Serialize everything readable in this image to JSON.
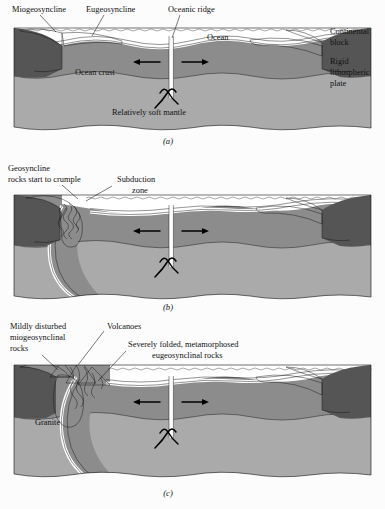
{
  "figure": {
    "background": "#fcfcfc"
  },
  "colors": {
    "continental_block": "#555555",
    "lithospheric_plate": "#8c8c8c",
    "soft_mantle": "#aaaaaa",
    "ocean_water": "#ffffff",
    "sediment": "#f4f4f4",
    "ink": "#111111",
    "page": "#fcfcfc"
  },
  "panels": [
    {
      "id": "a",
      "caption": "(a)",
      "labels": [
        {
          "name": "miogeosyncline",
          "text": "Miogeosyncline",
          "x": 12,
          "y": 10
        },
        {
          "name": "eugeosyncline",
          "text": "Eugeosyncline",
          "x": 86,
          "y": 10
        },
        {
          "name": "oceanic-ridge",
          "text": "Oceanic ridge",
          "x": 168,
          "y": 10
        },
        {
          "name": "ocean",
          "text": "Ocean",
          "x": 207,
          "y": 38
        },
        {
          "name": "ocean-crust",
          "text": "Ocean crust",
          "x": 75,
          "y": 73
        },
        {
          "name": "relatively-soft-mantle",
          "text": "Relatively soft mantle",
          "x": 112,
          "y": 113
        },
        {
          "name": "continental-block-line1",
          "text": "Continental",
          "x": 330,
          "y": 32
        },
        {
          "name": "continental-block-line2",
          "text": "block",
          "x": 330,
          "y": 43
        },
        {
          "name": "rigid-plate-line1",
          "text": "Rigid",
          "x": 330,
          "y": 62
        },
        {
          "name": "rigid-plate-line2",
          "text": "lithospheric",
          "x": 330,
          "y": 73
        },
        {
          "name": "rigid-plate-line3",
          "text": "plate",
          "x": 330,
          "y": 84
        }
      ]
    },
    {
      "id": "b",
      "caption": "(b)",
      "labels": [
        {
          "name": "geosyncline-line1",
          "text": "Geosyncline",
          "x": 8,
          "y": 9
        },
        {
          "name": "geosyncline-line2",
          "text": "rocks start to crumple",
          "x": 8,
          "y": 20
        },
        {
          "name": "subduction-line1",
          "text": "Subduction",
          "x": 117,
          "y": 20
        },
        {
          "name": "subduction-line2",
          "text": "zone",
          "x": 132,
          "y": 31
        }
      ]
    },
    {
      "id": "c",
      "caption": "(c)",
      "labels": [
        {
          "name": "mildly-disturbed-line1",
          "text": "Mildly disturbed",
          "x": 10,
          "y": 12
        },
        {
          "name": "mildly-disturbed-line2",
          "text": "miogeosynclinal",
          "x": 10,
          "y": 23
        },
        {
          "name": "mildly-disturbed-line3",
          "text": "rocks",
          "x": 10,
          "y": 34
        },
        {
          "name": "volcanoes",
          "text": "Volcanoes",
          "x": 107,
          "y": 12
        },
        {
          "name": "severely-folded-line1",
          "text": "Severely folded, metamorphosed",
          "x": 128,
          "y": 30
        },
        {
          "name": "severely-folded-line2",
          "text": "eugeosynclinal rocks",
          "x": 152,
          "y": 41
        },
        {
          "name": "granite",
          "text": "Granite",
          "x": 35,
          "y": 108
        }
      ]
    }
  ],
  "legend_terms": [
    "Miogeosyncline",
    "Eugeosyncline",
    "Oceanic ridge",
    "Ocean",
    "Ocean crust",
    "Relatively soft mantle",
    "Continental block",
    "Rigid lithospheric plate",
    "Geosyncline rocks start to crumple",
    "Subduction zone",
    "Mildly disturbed miogeosynclinal rocks",
    "Volcanoes",
    "Severely folded, metamorphosed eugeosynclinal rocks",
    "Granite"
  ]
}
